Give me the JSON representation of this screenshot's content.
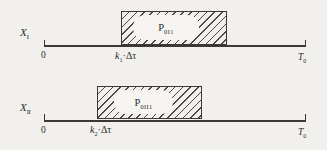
{
  "figure": {
    "type": "timing-diagram",
    "colors": {
      "background": "#f1f0ec",
      "paper": "#f6f5f1",
      "ink": "#3a3937",
      "hatch": "#4a4947"
    },
    "rows": [
      {
        "signal": {
          "base": "X",
          "sub": "I"
        },
        "axis": {
          "origin": "0",
          "end_base": "T",
          "end_sub": "0"
        },
        "pulse": {
          "p_base": "P",
          "p_sub": "0I1"
        },
        "delay": {
          "k_base": "k",
          "k_sub": "1",
          "dot": "·",
          "delta_tau": "Δτ"
        }
      },
      {
        "signal": {
          "base": "X",
          "sub": "II"
        },
        "axis": {
          "origin": "0",
          "end_base": "T",
          "end_sub": "0"
        },
        "pulse": {
          "p_base": "P",
          "p_sub": "0II1"
        },
        "delay": {
          "k_base": "k",
          "k_sub": "2",
          "dot": "·",
          "delta_tau": "Δτ"
        }
      }
    ]
  }
}
